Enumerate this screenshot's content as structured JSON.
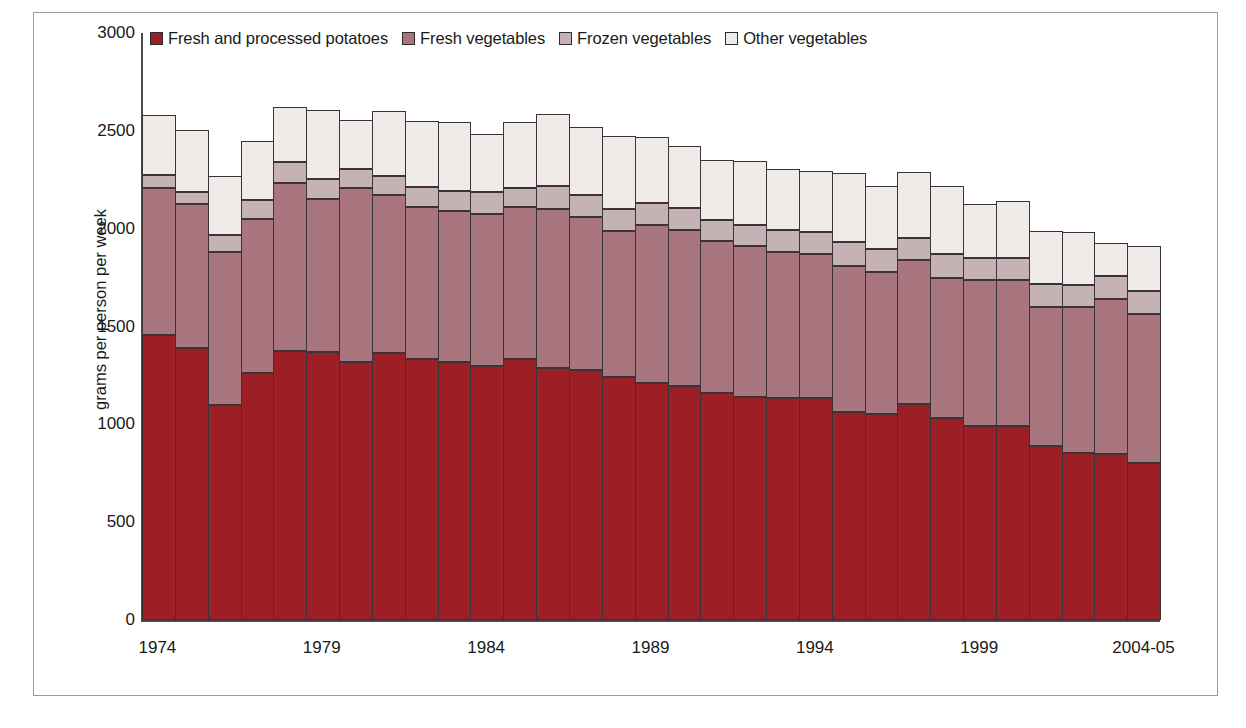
{
  "chart_data": {
    "type": "bar",
    "stacked": true,
    "title": "",
    "subtitle": "",
    "xlabel": "",
    "ylabel": "grams per person per week",
    "ylim": [
      0,
      3000
    ],
    "yticks": [
      0,
      500,
      1000,
      1500,
      2000,
      2500,
      3000
    ],
    "grid": false,
    "legend_position": "top",
    "x_tick_labels": [
      "1974",
      "1979",
      "1984",
      "1989",
      "1994",
      "1999",
      "2004-05"
    ],
    "x_tick_indices": [
      0,
      5,
      10,
      15,
      20,
      25,
      30
    ],
    "categories": [
      "1974",
      "1975",
      "1976",
      "1977",
      "1978",
      "1979",
      "1980",
      "1981",
      "1982",
      "1983",
      "1984",
      "1985",
      "1986",
      "1987",
      "1988",
      "1989",
      "1990",
      "1991",
      "1992",
      "1993",
      "1994",
      "1995",
      "1996",
      "1997",
      "1998",
      "1999",
      "2000",
      "2001",
      "2002",
      "2003",
      "2004-05"
    ],
    "series": [
      {
        "name": "Fresh and processed potatoes",
        "color": "#9b1f25",
        "values": [
          1455,
          1390,
          1100,
          1260,
          1375,
          1370,
          1320,
          1365,
          1335,
          1320,
          1300,
          1335,
          1290,
          1280,
          1240,
          1210,
          1195,
          1160,
          1140,
          1135,
          1135,
          1065,
          1055,
          1105,
          1030,
          990,
          990,
          890,
          855,
          850,
          800
        ]
      },
      {
        "name": "Fresh vegetables",
        "color": "#a9757e",
        "values": [
          755,
          735,
          780,
          790,
          860,
          780,
          890,
          805,
          775,
          770,
          775,
          775,
          810,
          780,
          750,
          810,
          800,
          775,
          770,
          745,
          735,
          745,
          725,
          735,
          720,
          750,
          750,
          710,
          745,
          790,
          765
        ]
      },
      {
        "name": "Frozen vegetables",
        "color": "#c5b2b5",
        "values": [
          65,
          60,
          90,
          95,
          105,
          105,
          95,
          100,
          105,
          105,
          110,
          100,
          120,
          110,
          110,
          110,
          110,
          110,
          110,
          115,
          115,
          120,
          115,
          110,
          120,
          110,
          110,
          115,
          110,
          120,
          115
        ]
      },
      {
        "name": "Other vegetables",
        "color": "#f0ebe9",
        "values": [
          305,
          320,
          300,
          305,
          280,
          350,
          250,
          330,
          335,
          350,
          300,
          335,
          365,
          350,
          375,
          340,
          320,
          305,
          325,
          310,
          310,
          355,
          325,
          340,
          350,
          275,
          290,
          275,
          275,
          165,
          230
        ]
      }
    ],
    "totals": [
      2580,
      2505,
      2270,
      2450,
      2620,
      2605,
      2555,
      2600,
      2550,
      2545,
      2485,
      2545,
      2585,
      2520,
      2475,
      2470,
      2425,
      2350,
      2345,
      2305,
      2295,
      2285,
      2220,
      2290,
      2220,
      2125,
      2140,
      1990,
      1985,
      1925,
      1910
    ]
  },
  "legend": {
    "items": [
      {
        "label": "Fresh and processed potatoes",
        "color": "#9b1f25"
      },
      {
        "label": "Fresh vegetables",
        "color": "#a9757e"
      },
      {
        "label": "Frozen vegetables",
        "color": "#c5b2b5"
      },
      {
        "label": "Other vegetables",
        "color": "#f0ebe9"
      }
    ]
  }
}
